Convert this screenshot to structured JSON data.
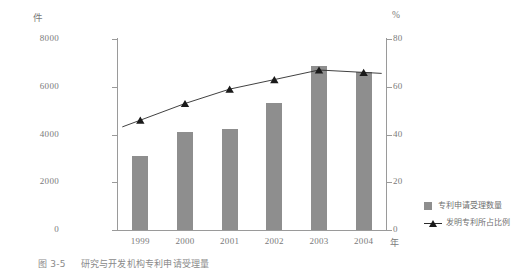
{
  "figure": {
    "caption_number": "图 3-5",
    "caption_text": "研究与开发机构专利申请受理量"
  },
  "axes": {
    "left_unit": "件",
    "right_unit": "%",
    "x_unit": "年",
    "left_ticks": [
      "8000",
      "6000",
      "4000",
      "2000",
      "0"
    ],
    "right_ticks": [
      "80",
      "60",
      "40",
      "20",
      "0"
    ],
    "x_ticks": [
      "1999",
      "2000",
      "2001",
      "2002",
      "2003",
      "2004"
    ]
  },
  "legend": {
    "bar_label": "专利申请受理数量",
    "line_label": "发明专利所占比例"
  },
  "colors": {
    "bar": "#8e8e8e",
    "line": "#2b2b2b",
    "marker": "#1a1a1a",
    "axis": "#9a9a9a",
    "text": "#7a7a7a"
  },
  "chart_data": {
    "type": "bar",
    "title": "研究与开发机构专利申请受理量",
    "xlabel": "年",
    "ylabel": "件",
    "y2label": "%",
    "categories": [
      "1999",
      "2000",
      "2001",
      "2002",
      "2003",
      "2004"
    ],
    "ylim": [
      0,
      8000
    ],
    "y2lim": [
      0,
      80
    ],
    "grid": false,
    "legend_position": "right",
    "series": [
      {
        "name": "专利申请受理数量",
        "type": "bar",
        "axis": "left",
        "unit": "件",
        "values": [
          3100,
          4100,
          4250,
          5300,
          6850,
          6600
        ]
      },
      {
        "name": "发明专利所占比例",
        "type": "line",
        "axis": "right",
        "unit": "%",
        "values": [
          46,
          53,
          59,
          63,
          67,
          66
        ]
      }
    ]
  }
}
